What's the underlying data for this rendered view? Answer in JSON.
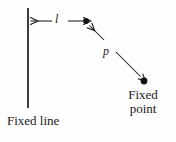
{
  "figure": {
    "background_color": "#fefefe",
    "ink_color": "#1a1a1a",
    "labels": {
      "distance_to_line": "l",
      "distance_to_point": "p",
      "fixed_line": "Fixed line",
      "fixed_point_line1": "Fixed",
      "fixed_point_line2": "point"
    },
    "geometry": {
      "directrix_line": {
        "x": 28,
        "y_top": 8,
        "y_bottom": 108
      },
      "moving_point": {
        "x": 86,
        "y": 21
      },
      "focus_point": {
        "x": 144,
        "y": 81
      },
      "segment_l": {
        "x_start": 29,
        "x_end": 84,
        "y": 21,
        "arrowheads": "both"
      },
      "segment_p": {
        "x_start": 88,
        "y_start": 24,
        "x_end": 142,
        "y_end": 78,
        "arrowheads": "both"
      }
    }
  }
}
